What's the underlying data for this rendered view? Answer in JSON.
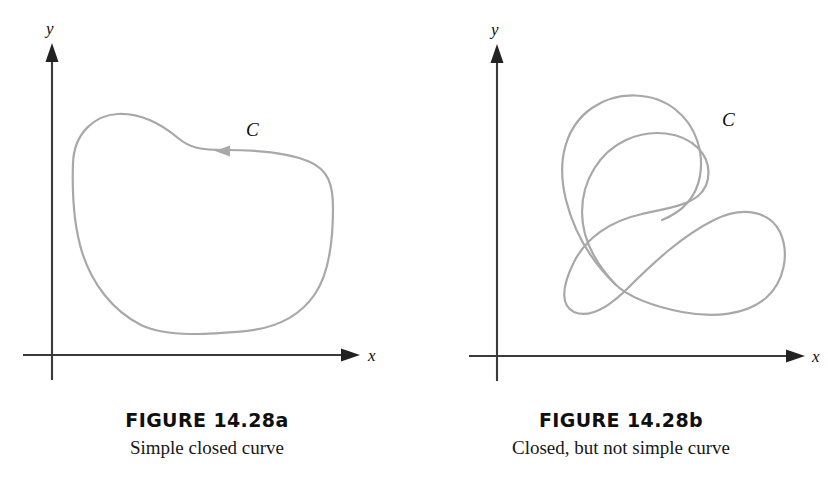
{
  "page": {
    "width": 828,
    "height": 492,
    "background": "#ffffff",
    "clipped_header_text": ""
  },
  "style": {
    "curve_color": "#a8a8a8",
    "axis_color": "#3a3a3a",
    "text_color": "#0d0d0d"
  },
  "figures": [
    {
      "id": "figure-14-28a",
      "caption_title": "FIGURE 14.28a",
      "caption_subtitle": "Simple closed curve",
      "axes": {
        "x_label": "x",
        "y_label": "y",
        "origin_x": 52,
        "origin_y": 355
      },
      "curve": {
        "label": "C",
        "label_x": 246,
        "label_y": 136,
        "orientation": "clockwise",
        "arrow_direction": "left",
        "arrow_x": 224,
        "arrow_y": 152,
        "closed": true,
        "self_intersecting": false,
        "extent": {
          "left": 73,
          "right": 333,
          "top": 113,
          "bottom": 333
        },
        "path": "M 226 150 C 200 150 190 148 178 138 C 160 123 140 113 118 114 C 95 115 74 133 73 163 C 72 193 74 226 82 252 C 92 284 113 311 141 325 C 168 338 212 334 246 331 C 276 328 300 316 315 294 C 330 272 333 236 333 208 C 333 184 328 170 310 162 C 290 153 256 150 226 150 Z"
      }
    },
    {
      "id": "figure-14-28b",
      "caption_title": "FIGURE 14.28b",
      "caption_subtitle": "Closed, but not simple curve",
      "axes": {
        "x_label": "x",
        "y_label": "y",
        "origin_x": 83,
        "origin_y": 356
      },
      "curve": {
        "label": "C",
        "label_x": 308,
        "label_y": 126,
        "orientation": "none",
        "closed": true,
        "self_intersecting": true,
        "crossing_x": 202,
        "crossing_y": 285,
        "extent": {
          "left": 123,
          "right": 368,
          "top": 92,
          "bottom": 318
        },
        "path_outer": "M 202 285 C 180 262 168 238 168 212 C 168 180 186 152 212 140 C 238 128 268 132 284 148 C 298 162 298 184 284 196 C 272 206 250 209 228 214 C 196 221 172 238 160 262 C 146 290 148 306 160 312 C 176 319 196 306 214 288 C 240 262 268 236 300 220 C 330 205 356 212 366 232 C 376 254 370 282 352 298 C 332 315 300 318 268 312 C 238 306 216 298 202 285 Z",
        "path_lobe": "M 202 285 C 178 262 160 232 152 200 C 142 160 152 126 178 108 C 204 90 240 92 262 110 C 282 126 290 152 286 176 C 282 198 268 212 248 220"
      }
    }
  ]
}
